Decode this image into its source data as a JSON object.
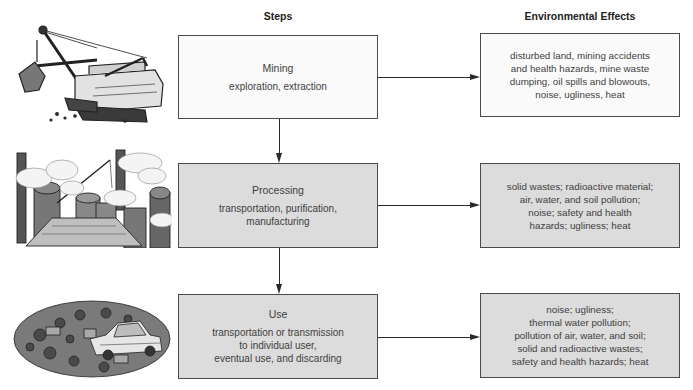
{
  "headers": {
    "steps": "Steps",
    "effects": "Environmental Effects"
  },
  "stages": [
    {
      "title": "Mining",
      "description": "exploration, extraction",
      "illustration": "power-shovel-excavator",
      "effects": "disturbed land, mining accidents\nand health hazards, mine waste\ndumping, oil spills and blowouts,\nnoise, ugliness, heat"
    },
    {
      "title": "Processing",
      "description": "transportation, purification,\nmanufacturing",
      "illustration": "industrial-smokestacks-refinery",
      "effects": "solid wastes; radioactive material;\nair, water, and soil pollution;\nnoise; safety and health\nhazards; ugliness; heat"
    },
    {
      "title": "Use",
      "description": "transportation or transmission\nto individual user,\neventual use, and discarding",
      "illustration": "junkyard-scrap-cars",
      "effects": "noise; ugliness;\nthermal water pollution;\npollution of air, water, and soil;\nsolid and radioactive wastes;\nsafety and health hazards; heat"
    }
  ],
  "colors": {
    "line": "#2a2a2a",
    "box_border": "#4a4a4a",
    "box_light": "#fafafa",
    "box_shaded": "#dcdcdc"
  }
}
